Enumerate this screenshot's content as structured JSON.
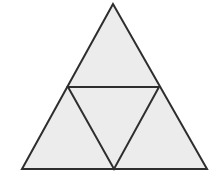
{
  "diagram": {
    "type": "subdivided-equilateral-triangle",
    "colors": {
      "fill": "#ececec",
      "stroke": "#2e2e2e",
      "background": "#ffffff"
    },
    "vertices": {
      "apex": [
        113,
        4
      ],
      "bottom_left": [
        22,
        169
      ],
      "bottom_right": [
        207,
        169
      ],
      "mid_left": [
        68,
        87
      ],
      "mid_right": [
        159,
        87
      ],
      "mid_bottom": [
        114,
        169
      ]
    },
    "sub_triangles": [
      {
        "name": "top",
        "points": "113,4 68,87 159,87"
      },
      {
        "name": "center",
        "points": "68,87 159,87 114,169"
      },
      {
        "name": "bottom-left",
        "points": "68,87 22,169 114,169"
      },
      {
        "name": "bottom-right",
        "points": "159,87 114,169 207,169"
      }
    ],
    "outer_points": "113,4 22,169 207,169",
    "inner_points": "68,87 159,87 114,169"
  }
}
